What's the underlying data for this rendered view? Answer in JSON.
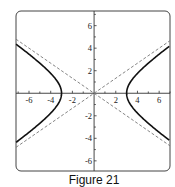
{
  "caption": "Figure 21",
  "chart_data": {
    "type": "line",
    "title": "",
    "caption": "Figure 21",
    "xlabel": "",
    "ylabel": "",
    "xlim": [
      -7.2,
      7.0
    ],
    "ylim": [
      -6.9,
      7.3
    ],
    "grid": false,
    "legend": null,
    "x_ticks": [
      -6,
      -4,
      -2,
      2,
      4,
      6
    ],
    "y_ticks": [
      6,
      4,
      2,
      -2,
      -4,
      -6
    ],
    "x_tick_labels": [
      "-6",
      "-4",
      "-2",
      "2",
      "4",
      "6"
    ],
    "y_tick_labels": [
      "6",
      "4",
      "2",
      "-2",
      "-4",
      "-6"
    ],
    "series": [
      {
        "name": "hyperbola x^2/9 - y^2/4 = 1",
        "style": "solid",
        "equation": "x^2/9 - y^2/4 = 1",
        "vertices": [
          [
            -3,
            0
          ],
          [
            3,
            0
          ]
        ]
      },
      {
        "name": "asymptote y = 2x/3",
        "style": "dashed",
        "equation": "y = (2/3)x"
      },
      {
        "name": "asymptote y = -2x/3",
        "style": "dashed",
        "equation": "y = -(2/3)x"
      }
    ]
  },
  "colors": {
    "curve": "#111111",
    "asymptote": "#777777",
    "axis": "#333333",
    "frame": "#444444"
  }
}
